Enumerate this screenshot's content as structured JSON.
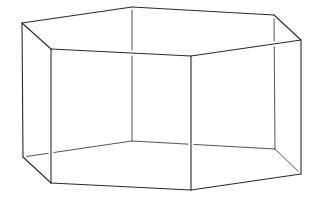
{
  "figure": {
    "width": 316,
    "height": 197,
    "background": "#ffffff",
    "stroke_color": "#2a2a2a",
    "hidden_stroke_color": "#555555",
    "vertices": {
      "top": {
        "A": [
          22,
          23
        ],
        "B": [
          51,
          49
        ],
        "F": [
          191,
          56
        ],
        "E": [
          301,
          40
        ],
        "D": [
          274,
          15
        ],
        "C": [
          132,
          7
        ]
      },
      "bottom": {
        "A": [
          23,
          157
        ],
        "B": [
          51,
          183
        ],
        "F": [
          191,
          190
        ],
        "E": [
          301,
          174
        ],
        "D": [
          275,
          149
        ],
        "C": [
          132,
          141
        ]
      }
    },
    "visible_edges": [
      [
        [
          22,
          23
        ],
        [
          132,
          7
        ]
      ],
      [
        [
          132,
          7
        ],
        [
          274,
          15
        ]
      ],
      [
        [
          274,
          15
        ],
        [
          301,
          40
        ]
      ],
      [
        [
          301,
          40
        ],
        [
          191,
          56
        ]
      ],
      [
        [
          191,
          56
        ],
        [
          51,
          49
        ]
      ],
      [
        [
          51,
          49
        ],
        [
          22,
          23
        ]
      ],
      [
        [
          22,
          23
        ],
        [
          23,
          157
        ]
      ],
      [
        [
          51,
          49
        ],
        [
          51,
          183
        ]
      ],
      [
        [
          191,
          56
        ],
        [
          191,
          190
        ]
      ],
      [
        [
          301,
          40
        ],
        [
          301,
          174
        ]
      ],
      [
        [
          23,
          157
        ],
        [
          51,
          183
        ]
      ],
      [
        [
          51,
          183
        ],
        [
          191,
          190
        ]
      ],
      [
        [
          191,
          190
        ],
        [
          301,
          174
        ]
      ]
    ],
    "hidden_edges": [
      [
        [
          132,
          7
        ],
        [
          132,
          141
        ]
      ],
      [
        [
          274,
          15
        ],
        [
          275,
          149
        ]
      ],
      [
        [
          23,
          157
        ],
        [
          132,
          141
        ]
      ],
      [
        [
          132,
          141
        ],
        [
          275,
          149
        ]
      ],
      [
        [
          275,
          149
        ],
        [
          301,
          174
        ]
      ]
    ]
  }
}
